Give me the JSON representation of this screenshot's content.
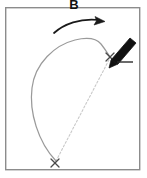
{
  "figure": {
    "panel_label": "B",
    "background_color": "#ffffff",
    "frame": {
      "name": "panel-border",
      "color": "#8c8c8c",
      "x": 5,
      "y": 7,
      "width": 135,
      "height": 163,
      "stroke_width": 1.4
    },
    "marks": {
      "start_marker_label": "×",
      "end_marker_label": "×",
      "start_point": {
        "x": 55,
        "y": 163
      },
      "end_point": {
        "x": 110,
        "y": 57
      },
      "marker_color": "#4a4a4a"
    },
    "trajectory": {
      "name": "curved-path",
      "color": "#9a9a9a",
      "stroke_width": 1.2,
      "style": "solid",
      "description": "looping curve bowing left from lower marker up to apex then down to upper marker",
      "apex": {
        "x": 96,
        "y": 40
      }
    },
    "chord": {
      "name": "dashed-chord",
      "color": "#c9c9c9",
      "stroke_width": 1.1,
      "style": "dashed",
      "dash_pattern": "2 2"
    },
    "direction_arrow": {
      "name": "direction-arrow",
      "color": "#1a1a1a",
      "stroke_width": 1.6,
      "from": {
        "x": 54,
        "y": 33
      },
      "to": {
        "x": 104,
        "y": 20
      }
    },
    "pen": {
      "name": "pen-icon",
      "body_color": "#111111",
      "tip_color": "#111111",
      "rule_color": "#2b2b2b",
      "angle_deg": 42,
      "tip_point": {
        "x": 112,
        "y": 56
      }
    }
  }
}
